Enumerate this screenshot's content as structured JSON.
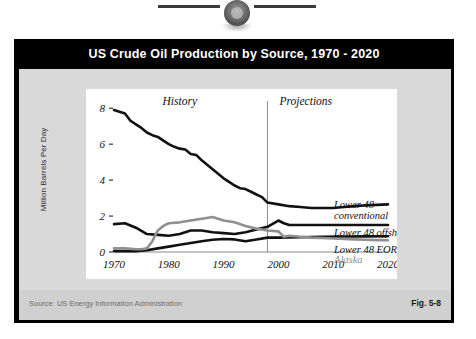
{
  "page": {
    "top_emblem_icon": "circular-seal-emblem"
  },
  "figure": {
    "title": "US Crude Oil Production by Source, 1970 - 2020",
    "source": "Source:  US Energy Information Administration",
    "figure_number": "Fig. 5-8"
  },
  "chart_data": {
    "type": "line",
    "title": "US Crude Oil Production by Source, 1970 - 2020",
    "xlabel": "",
    "ylabel": "Million Barrels Per Day",
    "xlim": [
      1970,
      2020
    ],
    "ylim": [
      0,
      8.4
    ],
    "xticks": [
      1970,
      1980,
      1990,
      2000,
      2010,
      2020
    ],
    "yticks": [
      0,
      2,
      4,
      6,
      8
    ],
    "grid": false,
    "legend_position": "right-inline",
    "annotations": [
      {
        "text": "History",
        "x": 1982,
        "y": 8.2
      },
      {
        "text": "Projections",
        "x": 2005,
        "y": 8.2
      },
      {
        "text": "projection-divider-line",
        "x": 1998,
        "y": 0
      }
    ],
    "divider_year": 1998,
    "series": [
      {
        "name": "Lower 48 conventional",
        "color": "#111111",
        "x": [
          1970,
          1971,
          1972,
          1973,
          1974,
          1975,
          1976,
          1977,
          1978,
          1979,
          1980,
          1981,
          1982,
          1983,
          1984,
          1985,
          1986,
          1987,
          1988,
          1989,
          1990,
          1991,
          1992,
          1993,
          1994,
          1995,
          1996,
          1997,
          1998,
          2000,
          2002,
          2004,
          2006,
          2008,
          2010,
          2012,
          2014,
          2016,
          2018,
          2020
        ],
        "y": [
          7.9,
          7.8,
          7.7,
          7.3,
          7.1,
          6.9,
          6.65,
          6.5,
          6.4,
          6.2,
          6.0,
          5.85,
          5.75,
          5.7,
          5.45,
          5.4,
          5.1,
          4.85,
          4.6,
          4.35,
          4.1,
          3.9,
          3.7,
          3.55,
          3.5,
          3.35,
          3.2,
          3.05,
          2.75,
          2.65,
          2.55,
          2.5,
          2.45,
          2.45,
          2.45,
          2.5,
          2.55,
          2.6,
          2.62,
          2.65
        ]
      },
      {
        "name": "Lower 48 offshore",
        "color": "#111111",
        "x": [
          1970,
          1972,
          1974,
          1976,
          1978,
          1980,
          1982,
          1984,
          1986,
          1988,
          1990,
          1992,
          1994,
          1996,
          1998,
          2000,
          2001,
          2002,
          2004,
          2006,
          2008,
          2010,
          2012,
          2014,
          2016,
          2018,
          2020
        ],
        "y": [
          1.55,
          1.6,
          1.35,
          1.0,
          0.95,
          0.9,
          1.0,
          1.2,
          1.2,
          1.1,
          1.05,
          1.0,
          1.1,
          1.25,
          1.4,
          1.75,
          1.6,
          1.5,
          1.5,
          1.5,
          1.5,
          1.5,
          1.5,
          1.5,
          1.5,
          1.5,
          1.5
        ]
      },
      {
        "name": "Lower 48 EOR",
        "color": "#111111",
        "x": [
          1970,
          1972,
          1974,
          1976,
          1978,
          1980,
          1982,
          1984,
          1986,
          1988,
          1990,
          1992,
          1994,
          1996,
          1998,
          2000,
          2004,
          2008,
          2012,
          2016,
          2020
        ],
        "y": [
          0.05,
          0.05,
          0.05,
          0.1,
          0.2,
          0.3,
          0.4,
          0.5,
          0.6,
          0.68,
          0.72,
          0.7,
          0.6,
          0.7,
          0.8,
          0.8,
          0.82,
          0.85,
          0.86,
          0.87,
          0.88
        ]
      },
      {
        "name": "Alaska",
        "color": "#8f8f8f",
        "x": [
          1970,
          1972,
          1974,
          1975,
          1976,
          1977,
          1978,
          1979,
          1980,
          1982,
          1984,
          1986,
          1988,
          1990,
          1992,
          1994,
          1996,
          1998,
          2000,
          2001,
          2002,
          2004,
          2006,
          2008,
          2010,
          2012,
          2014,
          2016,
          2018,
          2020
        ],
        "y": [
          0.2,
          0.2,
          0.15,
          0.15,
          0.2,
          0.6,
          1.2,
          1.45,
          1.6,
          1.65,
          1.75,
          1.85,
          1.95,
          1.75,
          1.65,
          1.45,
          1.3,
          1.2,
          1.15,
          0.85,
          0.9,
          0.85,
          0.8,
          0.78,
          0.75,
          0.72,
          0.7,
          0.68,
          0.66,
          0.65
        ]
      }
    ],
    "series_labels": [
      {
        "text": "Lower 48",
        "sub": "conventional"
      },
      {
        "text": "Lower 48 offshore"
      },
      {
        "text": "Lower 48 EOR"
      },
      {
        "text": "Alaska"
      }
    ]
  }
}
